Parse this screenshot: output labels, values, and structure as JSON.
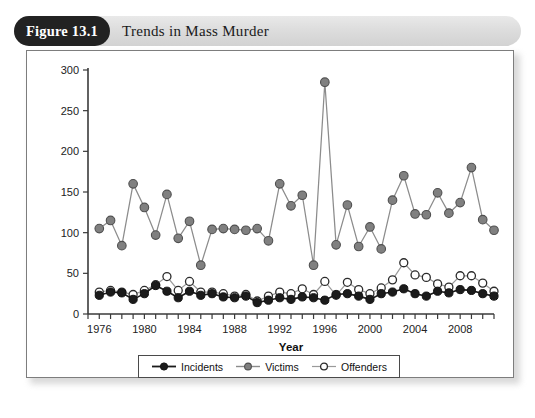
{
  "figure": {
    "badge": "Figure 13.1",
    "title": "Trends in Mass Murder"
  },
  "chart_data": {
    "type": "line",
    "title": "Trends in Mass Murder",
    "xlabel": "Year",
    "ylabel": "",
    "xlim": [
      1975,
      2011
    ],
    "ylim": [
      0,
      300
    ],
    "yticks": [
      0,
      50,
      100,
      150,
      200,
      250,
      300
    ],
    "xticks_labeled": [
      1976,
      1980,
      1984,
      1988,
      1992,
      1996,
      2000,
      2004,
      2008
    ],
    "xtick_step": 1,
    "grid": false,
    "legend_position": "bottom",
    "x": [
      1976,
      1977,
      1978,
      1979,
      1980,
      1981,
      1982,
      1983,
      1984,
      1985,
      1986,
      1987,
      1988,
      1989,
      1990,
      1991,
      1992,
      1993,
      1994,
      1995,
      1996,
      1997,
      1998,
      1999,
      2000,
      2001,
      2002,
      2003,
      2004,
      2005,
      2006,
      2007,
      2008,
      2009,
      2010,
      2011
    ],
    "series": [
      {
        "name": "Incidents",
        "color": "#1b1b1b",
        "marker": "filled-circle",
        "values": [
          23,
          27,
          26,
          18,
          25,
          35,
          28,
          20,
          28,
          23,
          25,
          21,
          20,
          22,
          14,
          17,
          20,
          18,
          21,
          20,
          17,
          24,
          25,
          22,
          18,
          25,
          27,
          31,
          25,
          22,
          28,
          26,
          30,
          29,
          25,
          22
        ]
      },
      {
        "name": "Victims",
        "color": "#808080",
        "marker": "gray-circle",
        "values": [
          105,
          115,
          84,
          160,
          131,
          97,
          147,
          93,
          114,
          60,
          104,
          105,
          104,
          103,
          105,
          90,
          160,
          133,
          146,
          60,
          285,
          85,
          134,
          83,
          107,
          80,
          140,
          170,
          123,
          122,
          149,
          124,
          137,
          180,
          116,
          103
        ]
      },
      {
        "name": "Offenders",
        "color": "#ffffff",
        "marker": "open-circle",
        "values": [
          27,
          29,
          27,
          24,
          29,
          36,
          46,
          29,
          40,
          27,
          27,
          25,
          22,
          24,
          16,
          22,
          27,
          25,
          31,
          24,
          40,
          23,
          39,
          30,
          25,
          32,
          42,
          63,
          48,
          45,
          37,
          33,
          47,
          47,
          38,
          28
        ]
      }
    ]
  },
  "legend": {
    "items": [
      {
        "label": "Incidents"
      },
      {
        "label": "Victims"
      },
      {
        "label": "Offenders"
      }
    ]
  }
}
